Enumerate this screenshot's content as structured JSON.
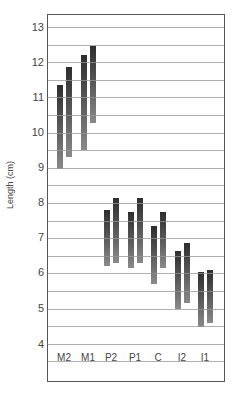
{
  "chart_data": {
    "type": "bar",
    "subtype": "floating-range",
    "title": "",
    "xlabel": "",
    "ylabel": "Length (cm)",
    "ylim": [
      3.3,
      13.4
    ],
    "yticks": [
      4,
      5,
      6,
      7,
      8,
      9,
      10,
      11,
      12,
      13
    ],
    "grid": "horizontal every 0.5",
    "legend": "none",
    "categories": [
      "M2",
      "M1",
      "P2",
      "P1",
      "C",
      "I2",
      "I1"
    ],
    "series": [
      {
        "name": "left bar",
        "ranges": [
          [
            8.95,
            11.35
          ],
          [
            9.5,
            12.2
          ],
          [
            6.2,
            7.8
          ],
          [
            6.15,
            7.75
          ],
          [
            5.7,
            7.35
          ],
          [
            5.0,
            6.65
          ],
          [
            4.5,
            6.05
          ]
        ]
      },
      {
        "name": "right bar",
        "ranges": [
          [
            9.3,
            11.85
          ],
          [
            10.25,
            12.45
          ],
          [
            6.3,
            8.15
          ],
          [
            6.3,
            8.15
          ],
          [
            6.15,
            7.75
          ],
          [
            5.15,
            6.85
          ],
          [
            4.6,
            6.1
          ]
        ]
      }
    ]
  },
  "labels": {
    "ylabel": "Length (cm)",
    "yticks": [
      "13",
      "12",
      "11",
      "10",
      "9",
      "8",
      "7",
      "6",
      "5",
      "4"
    ],
    "xticks": [
      "M2",
      "M1",
      "P2",
      "P1",
      "C",
      "I2",
      "I1"
    ]
  }
}
